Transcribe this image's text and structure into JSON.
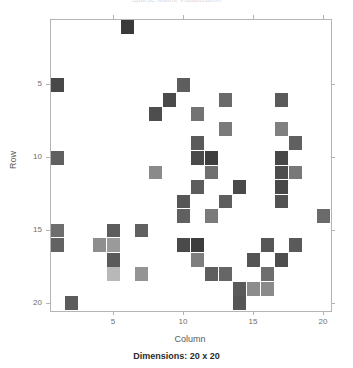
{
  "figure": {
    "title": "Sparse Matrix Visualization",
    "caption": "Dimensions: 20 x 20"
  },
  "axes": {
    "xlabel": "Column",
    "ylabel": "Row",
    "xticks": [
      5,
      10,
      15,
      20
    ],
    "yticks": [
      5,
      10,
      15,
      20
    ],
    "xticklabels": [
      "5",
      "10",
      "15",
      "20"
    ],
    "yticklabels": [
      "5",
      "10",
      "15",
      "20"
    ]
  },
  "chart_data": {
    "type": "heatmap",
    "title": "Sparse Matrix Visualization",
    "xlabel": "Column",
    "ylabel": "Row",
    "caption": "Dimensions: 20 x 20",
    "rows": 20,
    "cols": 20,
    "xlim": [
      0.5,
      20.5
    ],
    "ylim": [
      0.5,
      20.5
    ],
    "y_axis_inverted": true,
    "grid": false,
    "legend": null,
    "colormap": "grayscale",
    "background_color": "#ffffff",
    "value_range": [
      0.0,
      1.0
    ],
    "note": "Nonzero entries drawn as gray squares; darker = higher magnitude",
    "cells": [
      {
        "row": 1,
        "col": 6,
        "color": "#3a3a3a",
        "value": 0.86
      },
      {
        "row": 5,
        "col": 1,
        "color": "#484848",
        "value": 0.8
      },
      {
        "row": 5,
        "col": 10,
        "color": "#5e5e5e",
        "value": 0.71
      },
      {
        "row": 6,
        "col": 9,
        "color": "#4a4a4a",
        "value": 0.79
      },
      {
        "row": 6,
        "col": 13,
        "color": "#6a6a6a",
        "value": 0.66
      },
      {
        "row": 6,
        "col": 17,
        "color": "#5a5a5a",
        "value": 0.72
      },
      {
        "row": 7,
        "col": 8,
        "color": "#4e4e4e",
        "value": 0.77
      },
      {
        "row": 7,
        "col": 11,
        "color": "#737373",
        "value": 0.62
      },
      {
        "row": 8,
        "col": 13,
        "color": "#7a7a7a",
        "value": 0.59
      },
      {
        "row": 8,
        "col": 17,
        "color": "#808080",
        "value": 0.56
      },
      {
        "row": 9,
        "col": 11,
        "color": "#5a5a5a",
        "value": 0.72
      },
      {
        "row": 9,
        "col": 18,
        "color": "#606060",
        "value": 0.69
      },
      {
        "row": 10,
        "col": 1,
        "color": "#606060",
        "value": 0.69
      },
      {
        "row": 10,
        "col": 11,
        "color": "#4a4a4a",
        "value": 0.79
      },
      {
        "row": 10,
        "col": 12,
        "color": "#3e3e3e",
        "value": 0.84
      },
      {
        "row": 10,
        "col": 17,
        "color": "#474747",
        "value": 0.8
      },
      {
        "row": 11,
        "col": 8,
        "color": "#8a8a8a",
        "value": 0.52
      },
      {
        "row": 11,
        "col": 12,
        "color": "#707070",
        "value": 0.64
      },
      {
        "row": 11,
        "col": 17,
        "color": "#4c4c4c",
        "value": 0.78
      },
      {
        "row": 11,
        "col": 18,
        "color": "#787878",
        "value": 0.6
      },
      {
        "row": 12,
        "col": 11,
        "color": "#5c5c5c",
        "value": 0.71
      },
      {
        "row": 12,
        "col": 14,
        "color": "#4a4a4a",
        "value": 0.79
      },
      {
        "row": 12,
        "col": 17,
        "color": "#484848",
        "value": 0.8
      },
      {
        "row": 13,
        "col": 10,
        "color": "#565656",
        "value": 0.74
      },
      {
        "row": 13,
        "col": 13,
        "color": "#5e5e5e",
        "value": 0.7
      },
      {
        "row": 13,
        "col": 17,
        "color": "#525252",
        "value": 0.76
      },
      {
        "row": 14,
        "col": 10,
        "color": "#606060",
        "value": 0.69
      },
      {
        "row": 14,
        "col": 12,
        "color": "#7a7a7a",
        "value": 0.59
      },
      {
        "row": 14,
        "col": 20,
        "color": "#6a6a6a",
        "value": 0.66
      },
      {
        "row": 15,
        "col": 1,
        "color": "#6e6e6e",
        "value": 0.65
      },
      {
        "row": 15,
        "col": 5,
        "color": "#5c5c5c",
        "value": 0.71
      },
      {
        "row": 15,
        "col": 7,
        "color": "#606060",
        "value": 0.69
      },
      {
        "row": 16,
        "col": 1,
        "color": "#626262",
        "value": 0.68
      },
      {
        "row": 16,
        "col": 4,
        "color": "#8e8e8e",
        "value": 0.5
      },
      {
        "row": 16,
        "col": 5,
        "color": "#9a9a9a",
        "value": 0.45
      },
      {
        "row": 16,
        "col": 10,
        "color": "#4a4a4a",
        "value": 0.79
      },
      {
        "row": 16,
        "col": 11,
        "color": "#3c3c3c",
        "value": 0.85
      },
      {
        "row": 16,
        "col": 16,
        "color": "#575757",
        "value": 0.73
      },
      {
        "row": 16,
        "col": 18,
        "color": "#5a5a5a",
        "value": 0.72
      },
      {
        "row": 17,
        "col": 5,
        "color": "#5a5a5a",
        "value": 0.72
      },
      {
        "row": 17,
        "col": 11,
        "color": "#7e7e7e",
        "value": 0.57
      },
      {
        "row": 17,
        "col": 15,
        "color": "#545454",
        "value": 0.75
      },
      {
        "row": 17,
        "col": 17,
        "color": "#4e4e4e",
        "value": 0.77
      },
      {
        "row": 18,
        "col": 5,
        "color": "#b8b8b8",
        "value": 0.3
      },
      {
        "row": 18,
        "col": 7,
        "color": "#949494",
        "value": 0.47
      },
      {
        "row": 18,
        "col": 12,
        "color": "#5e5e5e",
        "value": 0.7
      },
      {
        "row": 18,
        "col": 13,
        "color": "#666666",
        "value": 0.67
      },
      {
        "row": 18,
        "col": 16,
        "color": "#6e6e6e",
        "value": 0.65
      },
      {
        "row": 19,
        "col": 14,
        "color": "#5a5a5a",
        "value": 0.72
      },
      {
        "row": 19,
        "col": 15,
        "color": "#8c8c8c",
        "value": 0.51
      },
      {
        "row": 19,
        "col": 16,
        "color": "#8a8a8a",
        "value": 0.52
      },
      {
        "row": 20,
        "col": 2,
        "color": "#5c5c5c",
        "value": 0.71
      },
      {
        "row": 20,
        "col": 14,
        "color": "#565656",
        "value": 0.74
      }
    ]
  }
}
